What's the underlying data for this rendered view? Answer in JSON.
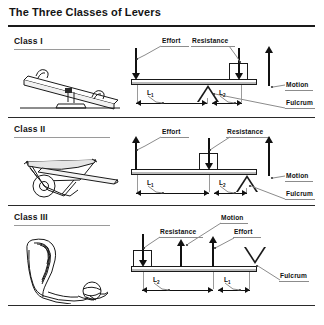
{
  "figure": {
    "title": "The Three Classes of Levers",
    "labels": {
      "effort": "Effort",
      "resistance": "Resistance",
      "motion": "Motion",
      "fulcrum": "Fulcrum",
      "length1": "L",
      "length1_sub": "1",
      "length2": "L",
      "length2_sub": "2"
    }
  },
  "classes": [
    {
      "name": "Class I",
      "illustration": "seesaw-illustration",
      "fulcrum_shape": "triangle-up",
      "fulcrum_position": "middle",
      "forces": [
        {
          "label": "Effort",
          "direction": "down",
          "position": "left"
        },
        {
          "label": "Resistance",
          "direction": "down",
          "position": "right"
        },
        {
          "label": "Motion",
          "direction": "up",
          "position": "far-right"
        }
      ],
      "dimensions": [
        {
          "label": "L",
          "sub": "1",
          "span": "effort-to-fulcrum"
        },
        {
          "label": "L",
          "sub": "2",
          "span": "fulcrum-to-resistance"
        }
      ]
    },
    {
      "name": "Class II",
      "illustration": "wheelbarrow-illustration",
      "fulcrum_shape": "triangle-up",
      "fulcrum_position": "right-end",
      "forces": [
        {
          "label": "Effort",
          "direction": "up",
          "position": "left"
        },
        {
          "label": "Resistance",
          "direction": "down",
          "position": "middle"
        },
        {
          "label": "Motion",
          "direction": "up",
          "position": "far-right"
        }
      ],
      "dimensions": [
        {
          "label": "L",
          "sub": "1",
          "span": "effort-to-resistance"
        },
        {
          "label": "L",
          "sub": "2",
          "span": "resistance-to-fulcrum"
        }
      ]
    },
    {
      "name": "Class III",
      "illustration": "arm-elbow-illustration",
      "fulcrum_shape": "triangle-down",
      "fulcrum_position": "right-end",
      "forces": [
        {
          "label": "Resistance",
          "direction": "down",
          "position": "left"
        },
        {
          "label": "Motion",
          "direction": "up",
          "position": "middle"
        },
        {
          "label": "Effort",
          "direction": "up",
          "position": "right"
        }
      ],
      "dimensions": [
        {
          "label": "L",
          "sub": "2",
          "span": "resistance-to-effort"
        },
        {
          "label": "L",
          "sub": "1",
          "span": "effort-to-fulcrum"
        }
      ]
    }
  ],
  "colors": {
    "ink": "#141414",
    "rule": "#2a2a2a",
    "leader": "#8c8c8c",
    "background": "#ffffff"
  }
}
